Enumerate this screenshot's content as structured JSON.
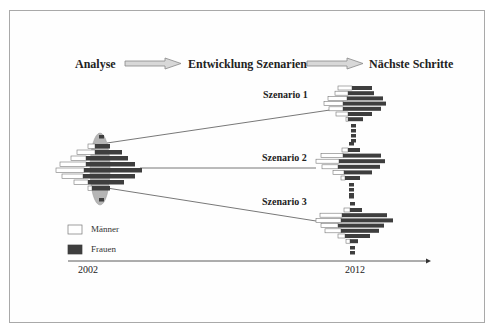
{
  "process": {
    "steps": [
      "Analyse",
      "Entwicklung Szenarien",
      "Nächste Schritte"
    ]
  },
  "scenarios": [
    "Szenario 1",
    "Szenario 2",
    "Szenario 3"
  ],
  "legend": {
    "male": "Männer",
    "female": "Frauen"
  },
  "timeline": {
    "start": "2002",
    "end": "2012"
  },
  "colors": {
    "male": "#ffffff",
    "female": "#3e3e3e",
    "highlight": "#b5b5b5",
    "arrow": "#d8d8d8"
  },
  "chart_data": {
    "type": "diagram",
    "title": "",
    "pyramids": [
      {
        "name": "2002",
        "rows": [
          [
            88,
            95,
            110
          ],
          [
            77,
            95,
            122
          ],
          [
            71,
            86,
            128
          ],
          [
            60,
            86,
            135
          ],
          [
            56,
            84,
            142
          ],
          [
            62,
            83,
            135
          ],
          [
            74,
            88,
            124
          ],
          [
            88,
            92,
            110
          ]
        ]
      },
      {
        "name": "Szenario 1",
        "rows": [
          [
            338,
            352,
            372
          ],
          [
            335,
            348,
            374
          ],
          [
            328,
            347,
            383
          ],
          [
            324,
            343,
            386
          ],
          [
            329,
            343,
            381
          ],
          [
            336,
            348,
            372
          ],
          [
            346,
            348,
            363
          ]
        ]
      },
      {
        "name": "Szenario 2",
        "rows": [
          [
            342,
            348,
            360
          ],
          [
            321,
            343,
            381
          ],
          [
            316,
            339,
            385
          ],
          [
            322,
            338,
            380
          ],
          [
            333,
            344,
            372
          ],
          [
            341,
            345,
            360
          ]
        ]
      },
      {
        "name": "Szenario 3",
        "rows": [
          [
            344,
            350,
            362
          ],
          [
            320,
            342,
            387
          ],
          [
            316,
            341,
            393
          ],
          [
            321,
            338,
            384
          ],
          [
            325,
            341,
            379
          ],
          [
            338,
            345,
            370
          ],
          [
            346,
            350,
            358
          ]
        ]
      }
    ]
  }
}
